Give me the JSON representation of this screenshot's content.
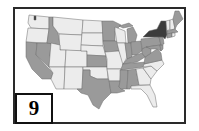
{
  "figure": {
    "panel_label": "9",
    "type": "US states choropleth (grayscale)"
  },
  "colors": {
    "dark": "#3c3c3c",
    "medium": "#9a9a9a",
    "light": "#ececec",
    "border": "#2a2a2a",
    "background": "#ffffff"
  },
  "map": {
    "highlighted_state": "NY",
    "categories": {
      "dark": [
        "NY"
      ],
      "medium": [
        "CA",
        "NV",
        "ID",
        "MN",
        "IA",
        "TX",
        "KS",
        "LA",
        "MS",
        "AL",
        "TN",
        "KY",
        "OH",
        "IN",
        "MI",
        "PA",
        "WV",
        "VA",
        "MD",
        "DE",
        "NJ",
        "ME",
        "CT",
        "MA"
      ],
      "light": [
        "WA",
        "OR",
        "MT",
        "WY",
        "ND",
        "SD",
        "NE",
        "UT",
        "CO",
        "AZ",
        "NM",
        "OK",
        "WI",
        "IL",
        "MO",
        "AR",
        "GA",
        "FL",
        "SC",
        "NC",
        "VT",
        "NH",
        "RI"
      ]
    }
  }
}
